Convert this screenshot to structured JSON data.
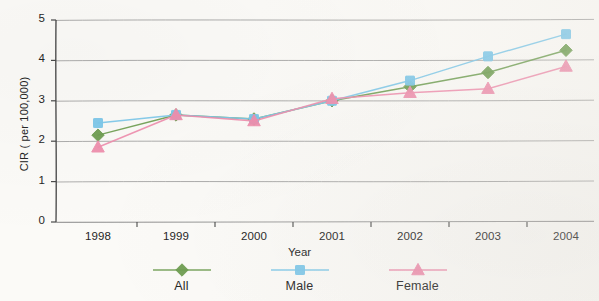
{
  "chart_data": {
    "type": "line",
    "title": "",
    "xlabel": "Year",
    "ylabel": "CIR ( per 100,000)",
    "categories": [
      "1998",
      "1999",
      "2000",
      "2001",
      "2002",
      "2003",
      "2004"
    ],
    "ylim": [
      0,
      5
    ],
    "ytick_labels": [
      "0",
      "1",
      "2",
      "3",
      "4",
      "5"
    ],
    "ytick_values": [
      0,
      1,
      2,
      3,
      4,
      5
    ],
    "grid": "horizontal",
    "legend_position": "bottom",
    "series": [
      {
        "name": "All",
        "color": "#6f9e52",
        "marker": "diamond",
        "values": [
          2.15,
          2.65,
          2.55,
          3.0,
          3.35,
          3.7,
          4.25
        ]
      },
      {
        "name": "Male",
        "color": "#7ec8ea",
        "marker": "square",
        "values": [
          2.45,
          2.65,
          2.55,
          3.0,
          3.5,
          4.1,
          4.65
        ]
      },
      {
        "name": "Female",
        "color": "#ef8fae",
        "marker": "triangle",
        "values": [
          1.85,
          2.65,
          2.5,
          3.05,
          3.2,
          3.3,
          3.85
        ]
      }
    ]
  },
  "axis": {
    "y_title": "CIR ( per 100,000)",
    "x_title": "Year"
  },
  "legend": {
    "items": [
      {
        "label": "All",
        "color": "#6f9e52",
        "marker": "diamond"
      },
      {
        "label": "Male",
        "color": "#7ec8ea",
        "marker": "square"
      },
      {
        "label": "Female",
        "color": "#ef8fae",
        "marker": "triangle"
      }
    ]
  },
  "colors": {
    "background": "#fbfaf7",
    "axis": "#4a4a4a",
    "gridline": "#8a8a8a",
    "all_series": "#6f9e52",
    "male_series": "#7ec8ea",
    "female_series": "#ef8fae"
  }
}
